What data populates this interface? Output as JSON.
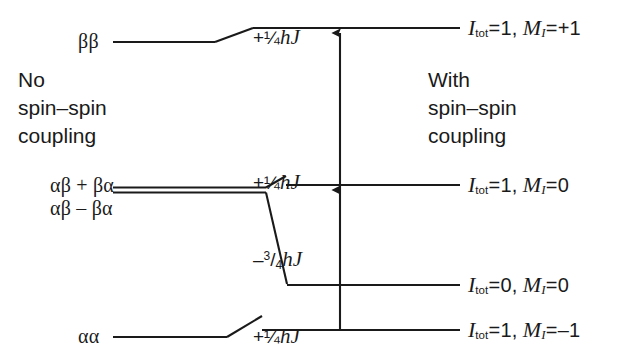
{
  "figure": {
    "background_color": "#ffffff",
    "line_color": "#1a1a1a"
  },
  "captions": {
    "left": {
      "line1": "No",
      "line2": "spin–spin",
      "line3": "coupling"
    },
    "right": {
      "line1": "With",
      "line2": "spin–spin",
      "line3": "coupling"
    }
  },
  "left_states": [
    {
      "id": "beta-beta",
      "label": "ββ"
    },
    {
      "id": "alpha-beta-plus-beta-alpha",
      "label": "αβ + βα"
    },
    {
      "id": "alpha-beta-minus-beta-alpha",
      "label": "αβ – βα"
    },
    {
      "id": "alpha-alpha",
      "label": "αα"
    }
  ],
  "energy_shifts": [
    {
      "id": "shift-top",
      "sign": "+",
      "numerator": "1",
      "denominator": "4",
      "glyph": "¼",
      "unit_h": "h",
      "unit_j": "J",
      "text": "+¼hJ"
    },
    {
      "id": "shift-middle",
      "sign": "+",
      "numerator": "1",
      "denominator": "4",
      "glyph": "¼",
      "unit_h": "h",
      "unit_j": "J",
      "text": "+¼hJ"
    },
    {
      "id": "shift-singlet",
      "sign": "–",
      "numerator": "3",
      "denominator": "4",
      "glyph": "",
      "unit_h": "h",
      "unit_j": "J",
      "text": "–3/4hJ"
    },
    {
      "id": "shift-bottom",
      "sign": "+",
      "numerator": "1",
      "denominator": "4",
      "glyph": "¼",
      "unit_h": "h",
      "unit_j": "J",
      "text": "+¼hJ"
    }
  ],
  "right_levels": [
    {
      "id": "level-triplet-plus1",
      "sym_i": "I",
      "sub_tot": "tot",
      "i_value": "1",
      "sym_m": "M",
      "sub_m": "I",
      "m_value": "+1",
      "comma": ","
    },
    {
      "id": "level-triplet-0",
      "sym_i": "I",
      "sub_tot": "tot",
      "i_value": "1",
      "sym_m": "M",
      "sub_m": "I",
      "m_value": "0",
      "comma": ","
    },
    {
      "id": "level-singlet-0",
      "sym_i": "I",
      "sub_tot": "tot",
      "i_value": "0",
      "sym_m": "M",
      "sub_m": "I",
      "m_value": "0",
      "comma": ","
    },
    {
      "id": "level-triplet-minus1",
      "sym_i": "I",
      "sub_tot": "tot",
      "i_value": "1",
      "sym_m": "M",
      "sub_m": "I",
      "m_value": "–1",
      "comma": ","
    }
  ],
  "equals": "=",
  "transition_arrow": {
    "id": "transition-arrow",
    "description": "vertical double-headed transition arrow"
  }
}
